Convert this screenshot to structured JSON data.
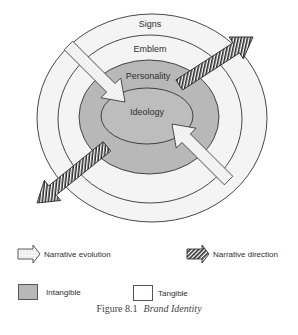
{
  "diagram": {
    "rings": [
      {
        "label": "Signs",
        "type": "tangible"
      },
      {
        "label": "Emblem",
        "type": "tangible"
      },
      {
        "label": "Personality",
        "type": "intangible"
      },
      {
        "label": "Ideology",
        "type": "intangible"
      }
    ],
    "arrows": [
      {
        "kind": "narrative-evolution",
        "from": "top-left",
        "to": "center"
      },
      {
        "kind": "narrative-evolution",
        "from": "bottom-right",
        "to": "center"
      },
      {
        "kind": "narrative-direction",
        "from": "center",
        "to": "top-right"
      },
      {
        "kind": "narrative-direction",
        "from": "center",
        "to": "bottom-left"
      }
    ],
    "colors": {
      "intangible": "#b8b8b8",
      "tangible": "#f4f4f4",
      "outline": "#333333"
    }
  },
  "legend": {
    "narrative_evolution": "Narrative evolution",
    "narrative_direction": "Narrative direction",
    "intangible": "Intangible",
    "tangible": "Tangible"
  },
  "caption": {
    "figure": "Figure 8.1",
    "title": "Brand Identity"
  }
}
